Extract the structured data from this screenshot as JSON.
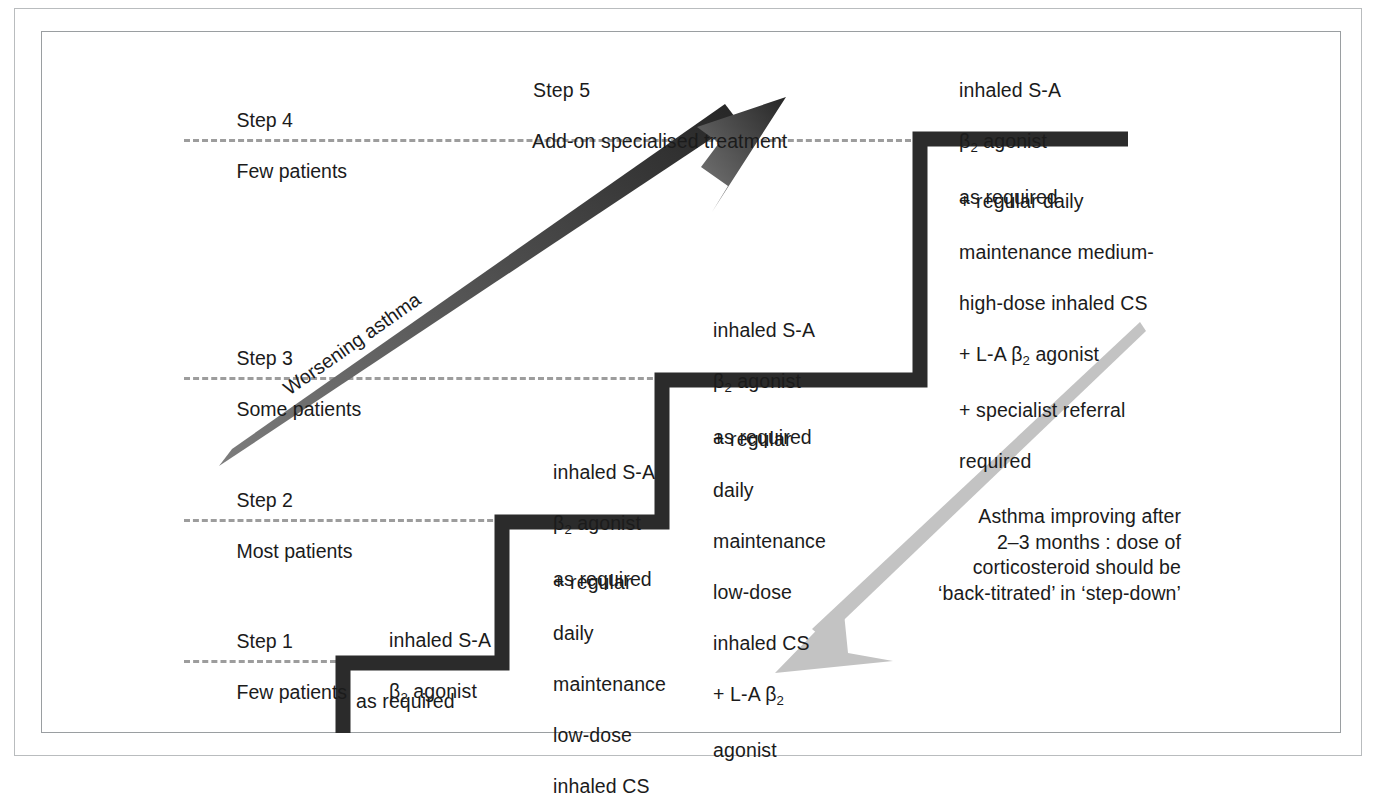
{
  "diagram": {
    "colors": {
      "stair": "#2b2b2b",
      "dashed_guide": "#9d9d9d",
      "worsening_arrow_dark": "#3a3a3a",
      "worsening_arrow_light": "#6f6f6f",
      "improving_arrow": "#c3c3c3",
      "frame": "#b9bcbe",
      "text": "#1b1b1b",
      "background": "#ffffff"
    },
    "steps": [
      {
        "id": "step1",
        "name": "Step 1",
        "patients": "Few patients"
      },
      {
        "id": "step2",
        "name": "Step 2",
        "patients": "Most patients"
      },
      {
        "id": "step3",
        "name": "Step 3",
        "patients": "Some patients"
      },
      {
        "id": "step4",
        "name": "Step 4",
        "patients": "Few patients"
      },
      {
        "id": "step5",
        "name": "Step 5",
        "patients": "Add-on specialised treatment"
      }
    ],
    "step5_heading": {
      "line1": "Step 5",
      "line2": "Add-on specialised treatment"
    },
    "treatments": {
      "step1": {
        "reliever_line1": "inhaled S-A",
        "reliever_line2_prefix": "",
        "reliever_beta": "β",
        "reliever_beta_sub": "2",
        "reliever_line2_suffix": " agonist",
        "as_required": "as required"
      },
      "step2": {
        "reliever_line1": "inhaled S-A",
        "reliever_beta": "β",
        "reliever_beta_sub": "2",
        "reliever_line2_suffix": " agonist",
        "reliever_line3": "as required",
        "addon": [
          "+ regular",
          "daily",
          "maintenance",
          "low-dose",
          "inhaled CS"
        ]
      },
      "step3": {
        "reliever_line1": "inhaled S-A",
        "reliever_beta": "β",
        "reliever_beta_sub": "2",
        "reliever_line2_suffix": " agonist",
        "reliever_line3": "as required",
        "addon_lines": [
          "+ regular",
          "daily",
          "maintenance",
          "low-dose",
          "inhaled CS"
        ],
        "addon_la_prefix": "+ L-A ",
        "addon_la_beta": "β",
        "addon_la_beta_sub": "2",
        "addon_la_last": "agonist"
      },
      "step4": {
        "reliever_line1": "inhaled S-A",
        "reliever_beta": "β",
        "reliever_beta_sub": "2",
        "reliever_line2_suffix": " agonist",
        "reliever_line3": "as required",
        "addon_lines": [
          "+ regular daily",
          "maintenance medium-",
          "high-dose inhaled CS"
        ],
        "addon_la_prefix": "+ L-A ",
        "addon_la_beta": "β",
        "addon_la_beta_sub": "2",
        "addon_la_suffix": " agonist",
        "addon_specialist_1": "+ specialist referral",
        "addon_specialist_2": "required"
      }
    },
    "arrows": {
      "worsening": {
        "label": "Worsening asthma",
        "direction": "up-right",
        "style": "solid-dark-gradient"
      },
      "improving": {
        "direction": "down-left",
        "style": "solid-light-grey",
        "caption_lines": [
          "Asthma improving after",
          "2–3 months : dose of",
          "corticosteroid should be",
          "‘back-titrated’ in ‘step-down’"
        ]
      }
    }
  }
}
